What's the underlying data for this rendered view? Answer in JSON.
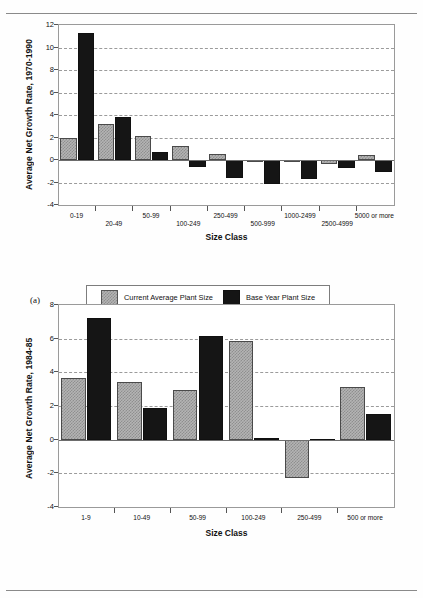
{
  "page": {
    "panel_a_label": "(a)",
    "panel_b_label": "(b)"
  },
  "legend": {
    "current_label": "Current Average Plant Size",
    "base_label": "Base Year Plant Size",
    "current_color": "#b4b4b4",
    "base_color": "#151515"
  },
  "chart_data": [
    {
      "id": "chart-a",
      "type": "bar",
      "title": "",
      "xlabel": "Size Class",
      "ylabel": "Average Net Growth Rate, 1970-1990",
      "ylim": [
        -4,
        12
      ],
      "yticks": [
        -4,
        -2,
        0,
        2,
        4,
        6,
        8,
        10,
        12
      ],
      "grid": true,
      "legend_position": "bottom",
      "categories": [
        "0-19",
        "20-49",
        "50-99",
        "100-249",
        "250-499",
        "500-999",
        "1000-2499",
        "2500-4999",
        "5000 or more"
      ],
      "series": [
        {
          "name": "Current Average Plant Size",
          "values": [
            2.0,
            3.2,
            2.1,
            1.25,
            0.55,
            -0.05,
            -0.05,
            -0.35,
            0.45
          ]
        },
        {
          "name": "Base Year Plant Size",
          "values": [
            11.3,
            3.85,
            0.75,
            -0.6,
            -1.6,
            -2.1,
            -1.7,
            -0.7,
            -1.1
          ]
        }
      ]
    },
    {
      "id": "chart-b",
      "type": "bar",
      "title": "",
      "xlabel": "Size Class",
      "ylabel": "Average Net Growth Rate, 1984-85",
      "ylim": [
        -4,
        8
      ],
      "yticks": [
        -4,
        -2,
        0,
        2,
        4,
        6,
        8
      ],
      "grid": true,
      "legend_position": "bottom",
      "categories": [
        "1-9",
        "10-49",
        "50-99",
        "100-249",
        "250-499",
        "500 or more"
      ],
      "series": [
        {
          "name": "Current Average Plant Size",
          "values": [
            3.65,
            3.45,
            2.95,
            5.85,
            -2.3,
            3.15
          ]
        },
        {
          "name": "Base Year Plant Size",
          "values": [
            7.25,
            1.9,
            6.15,
            0.08,
            0.06,
            1.55
          ]
        }
      ]
    }
  ]
}
